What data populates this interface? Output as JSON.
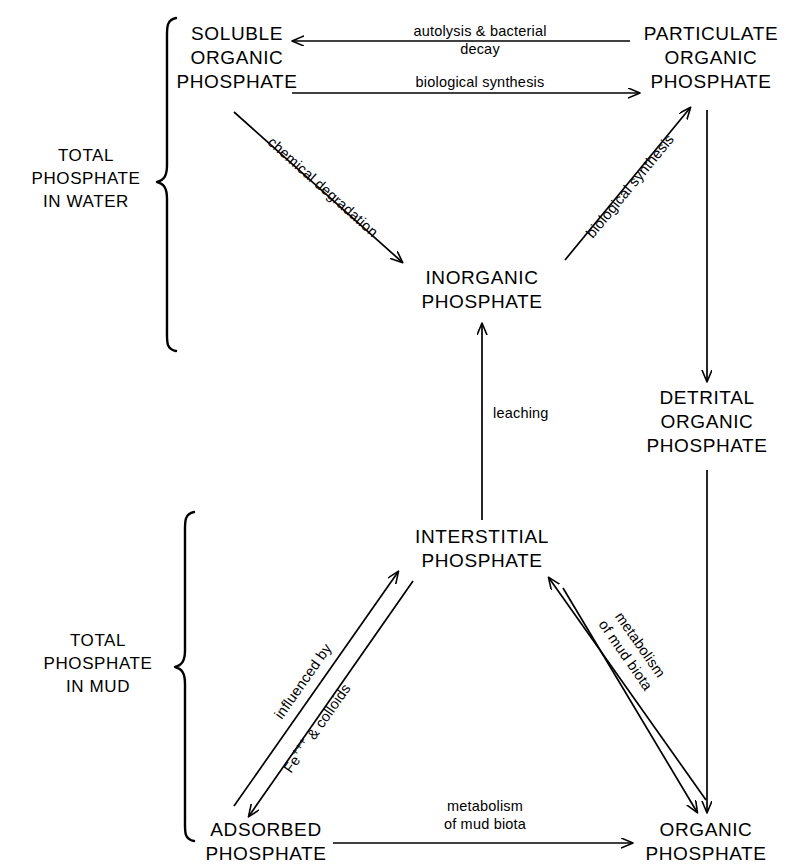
{
  "diagram": {
    "ink_color": "#000000",
    "background_color": "#ffffff",
    "nodes": [
      {
        "id": "soluble-organic-phosphate",
        "lines": [
          "SOLUBLE",
          "ORGANIC",
          "PHOSPHATE"
        ]
      },
      {
        "id": "particulate-organic-phosphate",
        "lines": [
          "PARTICULATE",
          "ORGANIC",
          "PHOSPHATE"
        ]
      },
      {
        "id": "inorganic-phosphate",
        "lines": [
          "INORGANIC",
          "PHOSPHATE"
        ]
      },
      {
        "id": "detrital-organic-phosphate",
        "lines": [
          "DETRITAL",
          "ORGANIC",
          "PHOSPHATE"
        ]
      },
      {
        "id": "interstitial-phosphate",
        "lines": [
          "INTERSTITIAL",
          "PHOSPHATE"
        ]
      },
      {
        "id": "adsorbed-phosphate",
        "lines": [
          "ADSORBED",
          "PHOSPHATE"
        ]
      },
      {
        "id": "organic-phosphate",
        "lines": [
          "ORGANIC",
          "PHOSPHATE"
        ]
      }
    ],
    "group_labels": [
      {
        "id": "total-phosphate-in-water",
        "lines": [
          "TOTAL",
          "PHOSPHATE",
          "IN WATER"
        ]
      },
      {
        "id": "total-phosphate-in-mud",
        "lines": [
          "TOTAL",
          "PHOSPHATE",
          "IN MUD"
        ]
      }
    ],
    "edge_labels": [
      {
        "id": "autolysis-bacterial-decay",
        "lines": [
          "autolysis & bacterial",
          "decay"
        ]
      },
      {
        "id": "biological-synthesis-top",
        "lines": [
          "biological  synthesis"
        ]
      },
      {
        "id": "chemical-degradation",
        "lines": [
          "chemical  degradation"
        ]
      },
      {
        "id": "biological-synthesis-right",
        "lines": [
          "biological  synthesis"
        ]
      },
      {
        "id": "leaching",
        "lines": [
          "leaching"
        ]
      },
      {
        "id": "influenced-by-colloids",
        "lines": [
          "influenced  by"
        ]
      },
      {
        "id": "fe-ions-colloids",
        "lines": [
          "Fe",
          "+++",
          " & colloids"
        ]
      },
      {
        "id": "metabolism-of-mud-biota-right",
        "lines": [
          "metabolism",
          "of  mud  biota"
        ]
      },
      {
        "id": "metabolism-of-mud-biota-bottom",
        "lines": [
          "metabolism",
          "of  mud  biota"
        ]
      }
    ]
  }
}
